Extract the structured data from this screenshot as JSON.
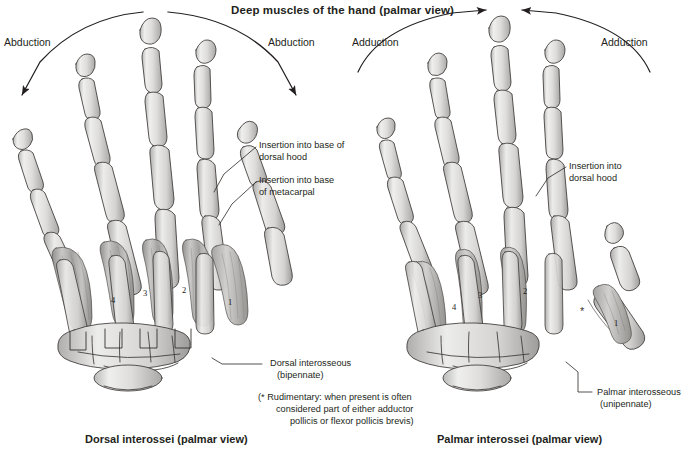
{
  "figure": {
    "title": "Deep muscles of the hand (palmar view)",
    "background_color": "#ffffff",
    "ink_color": "#231f20"
  },
  "panels": [
    {
      "id": "dorsal",
      "caption": "Dorsal interossei (palmar view)",
      "motion_label_left": "Abduction",
      "motion_label_right": "Abduction",
      "arrow_direction": "outward",
      "muscle_numbers": [
        "4",
        "3",
        "2",
        "1"
      ],
      "annotations": [
        {
          "id": "dorsal-hood",
          "text_line1": "Insertion into base of",
          "text_line2": "dorsal hood"
        },
        {
          "id": "metacarpal",
          "text_line1": "Insertion into base",
          "text_line2": "of metacarpal"
        }
      ],
      "muscle_callout": {
        "line1": "Dorsal interosseous",
        "line2": "(bipennate)"
      }
    },
    {
      "id": "palmar",
      "caption": "Palmar interossei (palmar view)",
      "motion_label_left": "Adduction",
      "motion_label_right": "Adduction",
      "arrow_direction": "inward",
      "muscle_numbers": [
        "4",
        "3",
        "2",
        "1"
      ],
      "rudimentary_marker": "*",
      "annotations": [
        {
          "id": "dorsal-hood",
          "text_line1": "Insertion into",
          "text_line2": "dorsal hood"
        }
      ],
      "muscle_callout": {
        "line1": "Palmar interosseous",
        "line2": "(unipennate)"
      }
    }
  ],
  "footnote": {
    "line1": "(* Rudimentary: when present is often",
    "line2": "considered part of either adductor",
    "line3": "pollicis or flexor pollicis brevis)"
  }
}
